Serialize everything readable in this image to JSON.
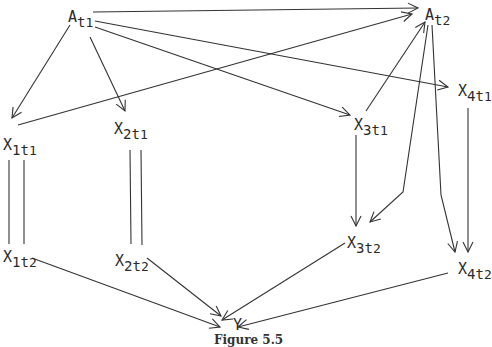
{
  "figure": {
    "caption": "Figure 5.5",
    "line_color": "#333333",
    "text_color": "#2a2a2a"
  },
  "nodes": {
    "A_t1": {
      "base": "A",
      "sub1": "t",
      "sub2": "1",
      "x": 68,
      "y": 10
    },
    "A_t2": {
      "base": "A",
      "sub1": "t",
      "sub2": "2",
      "x": 425,
      "y": 8
    },
    "X_1t1": {
      "base": "X",
      "sub1": "1t",
      "sub2": "1",
      "x": 3,
      "y": 138
    },
    "X_2t1": {
      "base": "X",
      "sub1": "2t",
      "sub2": "1",
      "x": 114,
      "y": 122
    },
    "X_3t1": {
      "base": "X",
      "sub1": "3t",
      "sub2": "1",
      "x": 354,
      "y": 118
    },
    "X_4t1": {
      "base": "X",
      "sub1": "4t",
      "sub2": "1",
      "x": 458,
      "y": 84
    },
    "X_1t2": {
      "base": "X",
      "sub1": "1t",
      "sub2": "2",
      "x": 3,
      "y": 250
    },
    "X_2t2": {
      "base": "X",
      "sub1": "2t",
      "sub2": "2",
      "x": 115,
      "y": 254
    },
    "X_3t2": {
      "base": "X",
      "sub1": "3t",
      "sub2": "2",
      "x": 347,
      "y": 236
    },
    "X_4t2": {
      "base": "X",
      "sub1": "4t",
      "sub2": "2",
      "x": 458,
      "y": 262
    },
    "Y": {
      "base": "Y",
      "sub1": "",
      "sub2": "",
      "x": 233,
      "y": 318
    }
  },
  "edges": [
    {
      "from": "A_t1",
      "to": "A_t2",
      "type": "arrow",
      "path": "M93,12 L418,8"
    },
    {
      "from": "A_t1",
      "to": "X_1t1",
      "type": "arrow",
      "path": "M70,25 L12,118"
    },
    {
      "from": "A_t1",
      "to": "X_2t1",
      "type": "arrow",
      "path": "M90,37 L125,111"
    },
    {
      "from": "A_t1",
      "to": "X_4t1",
      "type": "arrow",
      "path": "M95,21 L448,87"
    },
    {
      "from": "A_t1",
      "to": "X_3t1",
      "type": "arrow",
      "path": "M95,27 L350,115"
    },
    {
      "from": "X_1t1",
      "to": "A_t2",
      "type": "arrow",
      "path": "M18,125 L412,14"
    },
    {
      "from": "X_3t1",
      "to": "A_t2",
      "type": "arrow",
      "path": "M366,111 L425,22"
    },
    {
      "from": "A_t2",
      "to": "X_3t2",
      "type": "arrow",
      "path": "M428,25 L403,192 L370,222"
    },
    {
      "from": "A_t2",
      "to": "X_4t2",
      "type": "arrow",
      "path": "M432,25 L441,195 L455,252"
    },
    {
      "from": "X_3t1",
      "to": "X_3t2",
      "type": "arrow",
      "path": "M356,135 L356,226"
    },
    {
      "from": "X_4t1",
      "to": "X_4t2",
      "type": "arrow",
      "path": "M468,108 L468,252"
    },
    {
      "from": "X_1t1",
      "to": "X_1t2",
      "type": "double-line",
      "path": "M9,160 L9,244 M24,160 L24,244"
    },
    {
      "from": "X_2t1",
      "to": "X_2t2",
      "type": "double-line",
      "path": "M130,150 L131,244 M141,150 L142,245"
    },
    {
      "from": "X_1t2",
      "to": "Y",
      "type": "arrow",
      "path": "M32,258 L220,327"
    },
    {
      "from": "X_2t2",
      "to": "Y",
      "type": "arrow",
      "path": "M147,258 L221,316"
    },
    {
      "from": "X_3t2",
      "to": "Y",
      "type": "arrow",
      "path": "M345,243 L222,320"
    },
    {
      "from": "X_4t2",
      "to": "Y",
      "type": "arrow",
      "path": "M448,273 L238,327"
    }
  ]
}
